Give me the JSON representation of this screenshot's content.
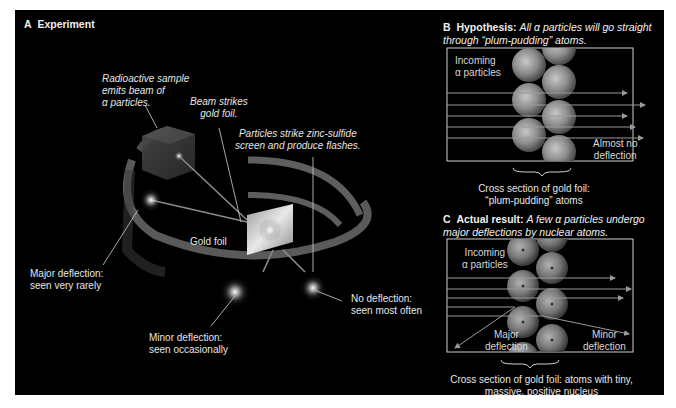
{
  "panel_a": {
    "letter": "A",
    "title": "Experiment",
    "labels": {
      "source": "Radioactive sample\nemits beam of\nα particles.",
      "beam": "Beam strikes\ngold foil.",
      "screen": "Particles strike zinc-sulfide\nscreen and produce flashes.",
      "foil": "Gold foil",
      "major": "Major deflection:\nseen very rarely",
      "minor": "Minor deflection:\nseen occasionally",
      "none": "No deflection:\nseen most often"
    }
  },
  "panel_b": {
    "letter": "B",
    "title": "Hypothesis:",
    "subtitle_line1": "All α particles will go straight",
    "subtitle_line2": "through “plum-pudding” atoms.",
    "incoming": "Incoming\nα particles",
    "result": "Almost no\ndeflection",
    "caption": "Cross section of gold foil:\n“plum-pudding” atoms"
  },
  "panel_c": {
    "letter": "C",
    "title": "Actual result:",
    "subtitle_line1": "A few α particles undergo",
    "subtitle_line2": "major deflections by nuclear atoms.",
    "incoming": "Incoming\nα particles",
    "major": "Major\ndeflection",
    "minor": "Minor\ndeflection",
    "caption": "Cross section of gold foil: atoms with tiny,\nmassive, positive nucleus"
  },
  "colors": {
    "background": "#000000",
    "text": "#e6e6e6",
    "ring": "#6a6a6a",
    "atom": "#8c8c8c",
    "box_border": "#cfcfcf"
  }
}
